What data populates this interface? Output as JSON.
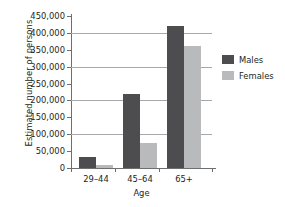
{
  "chart_data": {
    "type": "bar",
    "title": "",
    "xlabel": "Age",
    "ylabel": "Estimated number of persons",
    "categories": [
      "29–44",
      "45–64",
      "65+"
    ],
    "series": [
      {
        "name": "Males",
        "color": "#4d4d4f",
        "values": [
          32000,
          220000,
          420000
        ]
      },
      {
        "name": "Females",
        "color": "#b9babc",
        "values": [
          8000,
          73000,
          360000
        ]
      }
    ],
    "ylim": [
      0,
      450000
    ],
    "ytick_values": [
      0,
      50000,
      100000,
      150000,
      200000,
      250000,
      300000,
      350000,
      400000,
      450000
    ],
    "ytick_labels": [
      "0",
      "50,000",
      "100,000",
      "150,000",
      "200,000",
      "250,000",
      "300,000",
      "350,000",
      "400,000",
      "450,000"
    ],
    "gridlines_at": [
      100000,
      200000,
      300000,
      400000
    ],
    "grid": true,
    "legend_position": "right",
    "legend": [
      "Males",
      "Females"
    ]
  },
  "colors": {
    "males": "#4d4d4f",
    "females": "#b9babc",
    "axis": "#6d6e70",
    "grid": "#a7a9ac",
    "text": "#231f20",
    "background": "#ffffff"
  }
}
